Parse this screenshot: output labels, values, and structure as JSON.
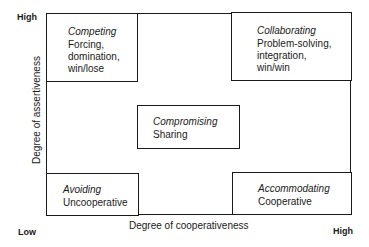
{
  "diagram": {
    "type": "conflict-management-styles-grid",
    "axes": {
      "x": {
        "title": "Degree of cooperativeness",
        "low": "Low",
        "high": "High"
      },
      "y": {
        "title": "Degree of assertiveness",
        "low": "Low",
        "high": "High"
      }
    },
    "styles": {
      "competing": {
        "title": "Competing",
        "description": "Forcing,\ndomination,\nwin/lose",
        "position": "top-left"
      },
      "collaborating": {
        "title": "Collaborating",
        "description": "Problem-solving,\nintegration,\nwin/win",
        "position": "top-right"
      },
      "compromising": {
        "title": "Compromising",
        "description": "Sharing",
        "position": "center"
      },
      "avoiding": {
        "title": "Avoiding",
        "description": "Uncooperative",
        "position": "bottom-left"
      },
      "accommodating": {
        "title": "Accommodating",
        "description": "Cooperative",
        "position": "bottom-right"
      }
    },
    "colors": {
      "line": "#1a1a1a",
      "background": "#ffffff",
      "text": "#1a1a1a"
    }
  }
}
